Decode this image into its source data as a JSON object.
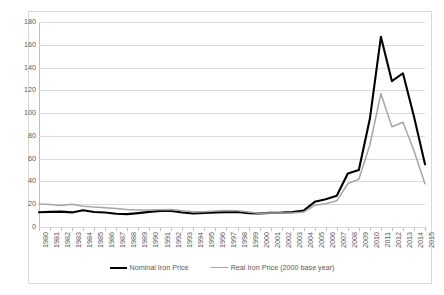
{
  "chart_data": {
    "type": "line",
    "title": "",
    "xlabel": "",
    "ylabel": "",
    "ylim": [
      0,
      180
    ],
    "y_ticks": [
      0,
      20,
      40,
      60,
      80,
      100,
      120,
      140,
      160,
      180
    ],
    "grid": true,
    "legend_position": "bottom-center",
    "categories": [
      "1980",
      "1981",
      "1982",
      "1983",
      "1984",
      "1985",
      "1986",
      "1987",
      "1988",
      "1989",
      "1990",
      "1991",
      "1992",
      "1993",
      "1994",
      "1995",
      "1996",
      "1997",
      "1998",
      "1999",
      "2000",
      "2001",
      "2002",
      "2003",
      "2004",
      "2005",
      "2006",
      "2007",
      "2008",
      "2009",
      "2010",
      "2011",
      "2012",
      "2013",
      "2014",
      "2015"
    ],
    "series": [
      {
        "name": "Nominal Iron Price",
        "color": "#000000",
        "values": [
          13.0,
          13.3,
          13.5,
          12.8,
          14.7,
          13.2,
          12.7,
          11.6,
          11.3,
          12.2,
          13.3,
          14.2,
          14.1,
          12.7,
          11.8,
          12.3,
          12.8,
          13.1,
          13.3,
          12.2,
          12.0,
          12.4,
          12.6,
          13.1,
          14.4,
          22.1,
          24.3,
          27.5,
          47.0,
          50.0,
          95.0,
          167.0,
          128.0,
          135.0,
          97.0,
          55.0
        ]
      },
      {
        "name": "Real Iron Price (2000 base year)",
        "color": "#a6a6a6",
        "values": [
          20.2,
          19.8,
          18.9,
          19.9,
          18.3,
          17.5,
          17.0,
          16.2,
          15.3,
          15.0,
          14.9,
          15.2,
          15.3,
          14.3,
          13.3,
          13.5,
          14.1,
          14.4,
          14.3,
          13.2,
          12.0,
          12.3,
          12.2,
          12.3,
          13.1,
          19.0,
          20.5,
          23.0,
          38.0,
          42.0,
          72.0,
          117.0,
          88.0,
          92.0,
          67.0,
          38.0
        ]
      }
    ],
    "legend": [
      {
        "label": "Nominal Iron Price",
        "swatch": "nominal"
      },
      {
        "label": "Real Iron Price (2000 base year)",
        "swatch": "real"
      }
    ]
  }
}
